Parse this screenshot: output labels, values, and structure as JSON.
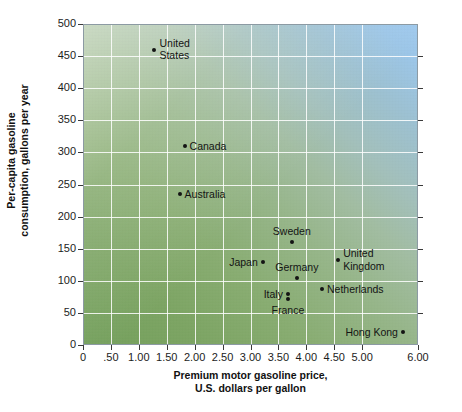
{
  "chart_data": {
    "type": "scatter",
    "title": "",
    "xlabel": "Premium motor gasoline price, U.S. dollars per gallon",
    "xlabel_lines": [
      "Premium motor gasoline price,",
      "U.S. dollars per gallon"
    ],
    "ylabel": "Per-capita gasoline consumption, gallons per year",
    "ylabel_lines": [
      "Per-capita gasoline",
      "consumption, gallons per year"
    ],
    "xlim": [
      0,
      6.0
    ],
    "ylim": [
      0,
      500
    ],
    "xticks": [
      0,
      0.5,
      1.0,
      1.5,
      2.0,
      2.5,
      3.0,
      3.5,
      4.0,
      4.5,
      5.0,
      6.0
    ],
    "xtick_labels": [
      "0",
      ".50",
      "1.00",
      "1.50",
      "2.00",
      "2.50",
      "3.00",
      "3.50",
      "4.00",
      "4.50",
      "5.00",
      "6.00"
    ],
    "yticks": [
      0,
      50,
      100,
      150,
      200,
      250,
      300,
      350,
      400,
      450,
      500
    ],
    "ytick_labels": [
      "0",
      "50",
      "100",
      "150",
      "200",
      "250",
      "300",
      "350",
      "400",
      "450",
      "500"
    ],
    "grid": true,
    "legend": "none",
    "points": [
      {
        "name": "United States",
        "label_lines": [
          "United",
          "States"
        ],
        "x": 1.28,
        "y": 460,
        "label_pos": "right"
      },
      {
        "name": "Canada",
        "label_lines": [
          "Canada"
        ],
        "x": 1.82,
        "y": 310,
        "label_pos": "right"
      },
      {
        "name": "Australia",
        "label_lines": [
          "Australia"
        ],
        "x": 1.73,
        "y": 235,
        "label_pos": "right"
      },
      {
        "name": "Sweden",
        "label_lines": [
          "Sweden"
        ],
        "x": 3.74,
        "y": 160,
        "label_pos": "above"
      },
      {
        "name": "Japan",
        "label_lines": [
          "Japan"
        ],
        "x": 3.22,
        "y": 130,
        "label_pos": "left"
      },
      {
        "name": "United Kingdom",
        "label_lines": [
          "United",
          "Kingdom"
        ],
        "x": 4.57,
        "y": 132,
        "label_pos": "right"
      },
      {
        "name": "Germany",
        "label_lines": [
          "Germany"
        ],
        "x": 3.83,
        "y": 105,
        "label_pos": "above"
      },
      {
        "name": "Italy",
        "label_lines": [
          "Italy"
        ],
        "x": 3.67,
        "y": 80,
        "label_pos": "left"
      },
      {
        "name": "Netherlands",
        "label_lines": [
          "Netherlands"
        ],
        "x": 4.28,
        "y": 88,
        "label_pos": "right"
      },
      {
        "name": "France",
        "label_lines": [
          "France"
        ],
        "x": 3.67,
        "y": 72,
        "label_pos": "below"
      },
      {
        "name": "Hong Kong",
        "label_lines": [
          "Hong Kong"
        ],
        "x": 5.73,
        "y": 20,
        "label_pos": "left"
      }
    ]
  },
  "colors": {
    "grid": "#ffffff",
    "point": "#141414",
    "text": "#141414",
    "gradient_low": "#74a05c",
    "gradient_high": "#9fc9ee",
    "background": "#ffffff"
  }
}
